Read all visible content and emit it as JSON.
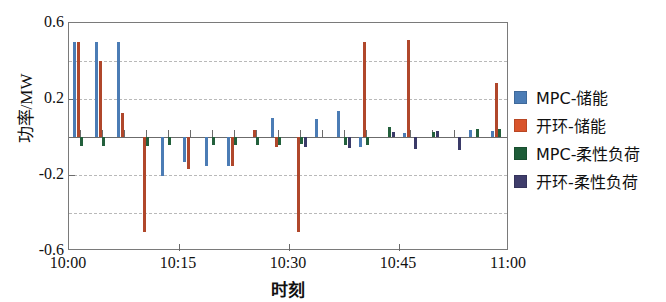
{
  "chart_data": {
    "type": "bar",
    "title": "",
    "xlabel": "时刻",
    "ylabel": "功率/MW",
    "xlim": [
      "10:00",
      "11:00"
    ],
    "ylim": [
      -0.6,
      0.6
    ],
    "ytick_labels": [
      "0.6",
      "0.2",
      "-0.2",
      "-0.6"
    ],
    "ytick_values": [
      0.6,
      0.2,
      -0.2,
      -0.6
    ],
    "gridlines": [
      0.4,
      0.2,
      0.0,
      -0.2,
      -0.4
    ],
    "grid": true,
    "legend_position": "right",
    "x_tick_labels": [
      "10:00",
      "10:15",
      "10:30",
      "10:45",
      "11:00"
    ],
    "x_tick_values": [
      0,
      15,
      30,
      45,
      60
    ],
    "categories": [
      "10:00",
      "10:03",
      "10:06",
      "10:09",
      "10:12",
      "10:15",
      "10:18",
      "10:21",
      "10:24",
      "10:27",
      "10:30",
      "10:33",
      "10:36",
      "10:39",
      "10:42",
      "10:45",
      "10:48",
      "10:51",
      "10:54",
      "10:57"
    ],
    "series": [
      {
        "name": "MPC-储能",
        "color": "#4b7cb5",
        "values": [
          0.5,
          0.5,
          0.5,
          0.0,
          -0.205,
          -0.13,
          -0.155,
          -0.15,
          0.0,
          0.1,
          0.0,
          0.095,
          0.135,
          -0.055,
          0.0,
          0.02,
          0.0,
          0.0,
          0.035,
          0.03
        ]
      },
      {
        "name": "开环-储能",
        "color": "#b0472b",
        "values": [
          0.5,
          0.4,
          0.125,
          -0.5,
          0.0,
          -0.17,
          0.0,
          -0.155,
          0.035,
          -0.055,
          -0.5,
          0.0,
          0.0,
          0.5,
          0.0,
          0.51,
          0.0,
          0.0,
          0.0,
          0.285
        ]
      },
      {
        "name": "MPC-柔性负荷",
        "color": "#23603c",
        "values": [
          -0.045,
          -0.045,
          0.0,
          -0.045,
          -0.04,
          0.0,
          -0.04,
          -0.04,
          -0.04,
          -0.04,
          -0.035,
          0.0,
          -0.04,
          -0.04,
          0.055,
          0.0,
          0.025,
          0.0,
          0.04,
          0.04
        ]
      },
      {
        "name": "开环-柔性负荷",
        "color": "#3a3a68",
        "values": [
          0.0,
          0.0,
          0.0,
          0.0,
          0.0,
          0.0,
          0.0,
          0.0,
          0.0,
          0.0,
          -0.055,
          0.0,
          -0.06,
          0.0,
          0.025,
          -0.065,
          0.03,
          -0.07,
          0.0,
          0.0
        ]
      }
    ]
  },
  "legend": {
    "items": [
      {
        "label": "MPC-储能",
        "color": "#4b7cb5"
      },
      {
        "label": "开环-储能",
        "color": "#d9542b"
      },
      {
        "label": "MPC-柔性负荷",
        "color": "#1d5c38"
      },
      {
        "label": "开环-柔性负荷",
        "color": "#3f3d6b"
      }
    ]
  },
  "axes": {
    "y_label": "功率/MW",
    "x_label": "时刻"
  }
}
